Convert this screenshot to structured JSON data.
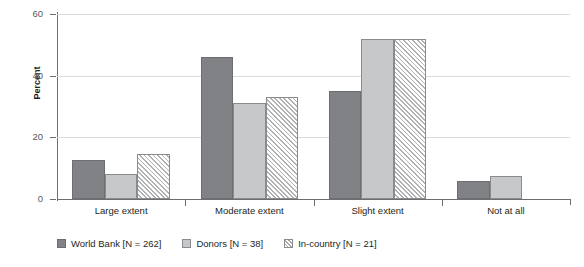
{
  "chart_data": {
    "type": "bar",
    "title": "",
    "xlabel": "",
    "ylabel": "Percent",
    "ylim": [
      0,
      60
    ],
    "yticks": [
      0,
      20,
      40,
      60
    ],
    "ytick_labels": [
      "0",
      "20",
      "40",
      "60"
    ],
    "grid": true,
    "legend_position": "bottom-left",
    "categories": [
      "Large extent",
      "Moderate extent",
      "Slight extent",
      "Not at all"
    ],
    "series": [
      {
        "name": "World Bank [N = 262]",
        "short_name": "World Bank",
        "n": 262,
        "color": "#818285",
        "pattern": "solid",
        "values": [
          12.5,
          46,
          35,
          6
        ]
      },
      {
        "name": "Donors [N = 38]",
        "short_name": "Donors",
        "n": 38,
        "color": "#c7c8ca",
        "pattern": "solid",
        "values": [
          8,
          31,
          52,
          7.5
        ]
      },
      {
        "name": "In-country [N = 21]",
        "short_name": "In-country",
        "n": 21,
        "color": "#ffffff",
        "pattern": "diagonal-hatch",
        "values": [
          14.5,
          33,
          52,
          0
        ]
      }
    ]
  },
  "axis": {
    "y_title": "Percent"
  }
}
